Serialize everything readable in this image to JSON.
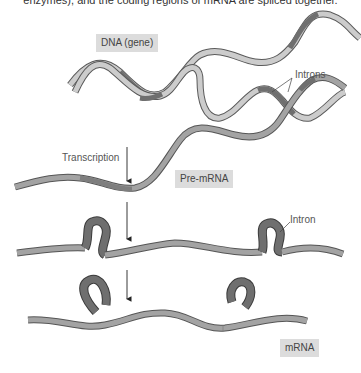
{
  "caption": {
    "top_text_cut": "enzymes), and the coding regions of mRNA are spliced together."
  },
  "labels": {
    "dna": "DNA (gene)",
    "introns": "Introns",
    "transcription": "Transcription",
    "pre_mrna": "Pre-mRNA",
    "intron": "Intron",
    "mrna": "mRNA"
  },
  "colors": {
    "exon_light": "#cccccc",
    "exon_mid": "#a3a3a3",
    "intron_dark": "#6f6f6f",
    "outline": "#5a5a5a",
    "label_bg": "#dcdcdc"
  },
  "stages": [
    {
      "name": "DNA (gene)",
      "description": "double-stranded gene with exons and introns"
    },
    {
      "name": "Pre-mRNA",
      "description": "transcribed single strand with introns"
    },
    {
      "name": "Splicing",
      "description": "introns loop out"
    },
    {
      "name": "mRNA",
      "description": "introns removed, exons joined"
    }
  ]
}
